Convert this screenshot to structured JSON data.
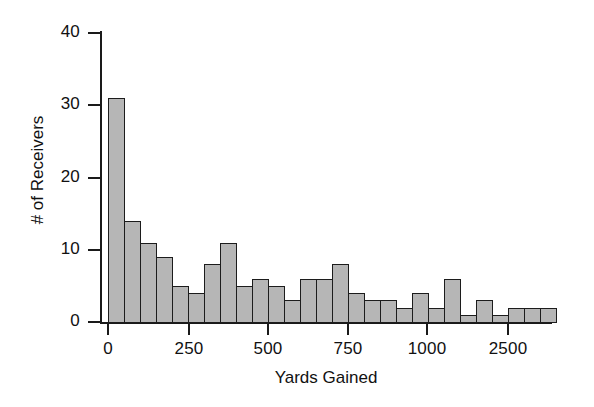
{
  "chart_data": {
    "type": "bar",
    "title": "",
    "xlabel": "Yards Gained",
    "ylabel": "# of Receivers",
    "grid": false,
    "legend": false,
    "ylim": [
      0,
      40
    ],
    "ytick_values": [
      0,
      10,
      20,
      30,
      40
    ],
    "ytick_labels": [
      "0",
      "10",
      "20",
      "30",
      "40"
    ],
    "xtick_values": [
      0,
      250,
      500,
      750,
      1000,
      2500
    ],
    "xtick_labels": [
      "0",
      "250",
      "500",
      "750",
      "1000",
      "2500"
    ],
    "bin_width": 50,
    "note": "x-axis is not linear past 1000; final labeled tick reads 2500",
    "categories": [
      "0-50",
      "50-100",
      "100-150",
      "150-200",
      "200-250",
      "250-300",
      "300-350",
      "350-400",
      "400-450",
      "450-500",
      "500-550",
      "550-600",
      "600-650",
      "650-700",
      "700-750",
      "750-800",
      "800-850",
      "850-900",
      "900-950",
      "950-1000",
      "1000-1050",
      "1050-1100",
      "1100-1150",
      "1150-1200",
      "1200-1250",
      "1250-1300",
      "1300-1350",
      "1350-1400"
    ],
    "values": [
      31,
      14,
      11,
      9,
      5,
      4,
      8,
      11,
      5,
      6,
      5,
      3,
      6,
      6,
      8,
      4,
      3,
      3,
      2,
      4,
      2,
      6,
      1,
      3,
      1,
      2,
      2,
      2
    ],
    "bar_color": "#b6b6b6",
    "bar_edge_color": "#1c1c1c",
    "axis_color": "#1a1a1a"
  }
}
